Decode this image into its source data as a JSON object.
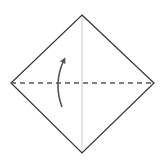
{
  "diagram": {
    "type": "origami-fold-step",
    "colors": {
      "background": "#ffffff",
      "outline": "#333333",
      "crease": "#c8c8c8",
      "fold_line": "#555555",
      "arrow": "#555555"
    },
    "shape": {
      "vertices": {
        "top": [
          82,
          15
        ],
        "right": [
          154,
          83
        ],
        "bottom": [
          82,
          153
        ],
        "left": [
          11,
          83
        ]
      }
    },
    "crease_line": {
      "from": [
        82,
        15
      ],
      "to": [
        82,
        153
      ],
      "style": "solid-thin"
    },
    "fold_line": {
      "from": [
        11,
        83
      ],
      "to": [
        154,
        83
      ],
      "style": "dashed",
      "kind": "valley-fold"
    },
    "fold_arrow": {
      "start": [
        62,
        107
      ],
      "control": [
        53,
        83
      ],
      "end": [
        64,
        60
      ],
      "direction": "up"
    }
  }
}
